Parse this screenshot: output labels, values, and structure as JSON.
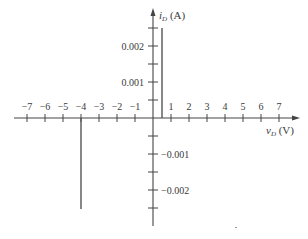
{
  "chart_data": {
    "type": "line",
    "title": "",
    "xlabel": "v_D (V)",
    "ylabel": "i_D (A)",
    "xlabel_main": "v",
    "xlabel_sub": "D",
    "xlabel_unit": " (V)",
    "ylabel_main": "i",
    "ylabel_sub": "D",
    "ylabel_unit": " (A)",
    "xlim": [
      -7.8,
      7.9
    ],
    "ylim": [
      -0.0029,
      0.003
    ],
    "grid": false,
    "legend": null,
    "x_ticks": [
      -7,
      -6,
      -5,
      -4,
      -3,
      -2,
      -1,
      1,
      2,
      3,
      4,
      5,
      6,
      7
    ],
    "x_tick_labels": [
      "−7",
      "−6",
      "−5",
      "−4",
      "−3",
      "−2",
      "−1",
      "1",
      "2",
      "3",
      "4",
      "5",
      "6",
      "7"
    ],
    "y_ticks": [
      -0.0025,
      -0.002,
      -0.0015,
      -0.001,
      -0.0005,
      0.0005,
      0.001,
      0.0015,
      0.002,
      0.0025
    ],
    "y_labeled_ticks": [
      0.002,
      0.001,
      -0.001,
      -0.002
    ],
    "y_tick_labels": [
      "0.002",
      "0.001",
      "−0.001",
      "−0.002"
    ],
    "series": [
      {
        "name": "forward conduction (vertical segment at v_D = 0.5 V)",
        "x": [
          0.5,
          0.5
        ],
        "y": [
          0,
          0.0025
        ]
      },
      {
        "name": "reverse breakdown (vertical segment at v_D = -4 V)",
        "x": [
          -4,
          -4
        ],
        "y": [
          0,
          -0.0025
        ]
      },
      {
        "name": "off region (along v_D axis)",
        "x": [
          -4,
          0.5
        ],
        "y": [
          0,
          0
        ]
      }
    ],
    "line_color": "#555555",
    "axis_color": "#444444"
  }
}
